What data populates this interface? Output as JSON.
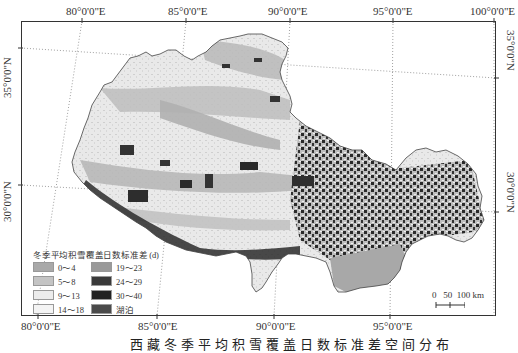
{
  "map": {
    "title_caption": "西藏冬季平均积雪覆盖日数标准差空间分布",
    "top_lon_labels": [
      "80°0'0\"E",
      "85°0'0\"E",
      "90°0'0\"E",
      "95°0'0\"E",
      "100°0'0\"E"
    ],
    "bottom_lon_labels": [
      "80°0'0\"E",
      "85°0'0\"E",
      "90°0'0\"E",
      "95°0'0\"E"
    ],
    "left_lat_labels": [
      "35°0'0\"N",
      "30°0'0\"N"
    ],
    "right_lat_labels": [
      "35°0'0\"N",
      "30°0'0\"N"
    ],
    "legend": {
      "title": "冬季平均积雪覆盖日数标准差 (d)",
      "items": [
        {
          "label": "0～4",
          "color": "#a9a9a9"
        },
        {
          "label": "19～23",
          "color": "#9a9a9a"
        },
        {
          "label": "5～8",
          "color": "#c4c4c4"
        },
        {
          "label": "24～29",
          "color": "#3a3a3a"
        },
        {
          "label": "9～13",
          "color": "#ececec"
        },
        {
          "label": "30～40",
          "color": "#222222"
        },
        {
          "label": "14～18",
          "color": "#f4f4f4"
        },
        {
          "label": "湖泊",
          "color": "#4a4a4a"
        }
      ]
    },
    "scale_bar": {
      "labels": [
        "0",
        "50",
        "100 km"
      ]
    }
  }
}
